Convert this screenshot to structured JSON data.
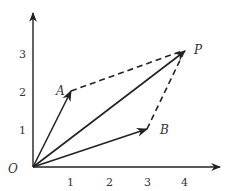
{
  "diagram": {
    "type": "vector-parallelogram",
    "origin_label": "O",
    "x_ticks": [
      "1",
      "2",
      "3",
      "4"
    ],
    "y_ticks": [
      "1",
      "2",
      "3"
    ],
    "points": [
      {
        "label": "A",
        "x": 1,
        "y": 2
      },
      {
        "label": "B",
        "x": 3,
        "y": 1
      },
      {
        "label": "P",
        "x": 4,
        "y": 3
      }
    ],
    "vectors": [
      {
        "from": "O",
        "to": "A",
        "style": "solid"
      },
      {
        "from": "O",
        "to": "B",
        "style": "solid"
      },
      {
        "from": "O",
        "to": "P",
        "style": "solid"
      }
    ],
    "dashed_segments": [
      {
        "from": "A",
        "to": "P"
      },
      {
        "from": "B",
        "to": "P"
      }
    ],
    "colors": {
      "stroke": "#222222",
      "text": "#333333",
      "background": "#ffffff"
    }
  }
}
